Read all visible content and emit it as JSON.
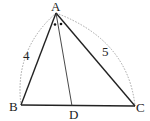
{
  "diagram": {
    "type": "triangle-angle-bisector",
    "points": {
      "A": {
        "label": "A",
        "x": 56,
        "y": 13
      },
      "B": {
        "label": "B",
        "x": 21,
        "y": 105
      },
      "C": {
        "label": "C",
        "x": 135,
        "y": 106
      },
      "D": {
        "label": "D",
        "x": 72,
        "y": 106
      }
    },
    "side_labels": {
      "AB": "4",
      "AC": "5"
    },
    "angle_marks": "two dots indicating equal angles BAD and DAC",
    "colors": {
      "line": "#222222",
      "dashed": "#999999",
      "text": "#222222"
    }
  }
}
